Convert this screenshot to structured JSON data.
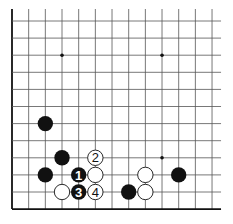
{
  "diagram": {
    "type": "go-board-fragment",
    "colors": {
      "background": "#ffffff",
      "line": "#555555",
      "edge": "#111111",
      "black_stone": "#111111",
      "white_stone": "#ffffff"
    },
    "grid": {
      "cols": 13,
      "rows": 12,
      "origin_x": 12,
      "origin_y": 21,
      "spacing_x": 16.67,
      "spacing_y": 17.1,
      "open_top": true,
      "open_right": true,
      "edge_left": true,
      "edge_bottom": true
    },
    "star_points": [
      {
        "col": 3,
        "row": 2
      },
      {
        "col": 9,
        "row": 2
      },
      {
        "col": 9,
        "row": 8
      }
    ],
    "stones": [
      {
        "color": "black",
        "col": 2,
        "row": 6,
        "label": ""
      },
      {
        "color": "black",
        "col": 3,
        "row": 8,
        "label": ""
      },
      {
        "color": "black",
        "col": 2,
        "row": 9,
        "label": ""
      },
      {
        "color": "black",
        "col": 4,
        "row": 9,
        "label": "1"
      },
      {
        "color": "black",
        "col": 4,
        "row": 10,
        "label": "3"
      },
      {
        "color": "black",
        "col": 7,
        "row": 10,
        "label": ""
      },
      {
        "color": "black",
        "col": 10,
        "row": 9,
        "label": ""
      },
      {
        "color": "white",
        "col": 5,
        "row": 8,
        "label": "2"
      },
      {
        "color": "white",
        "col": 5,
        "row": 9,
        "label": ""
      },
      {
        "color": "white",
        "col": 5,
        "row": 10,
        "label": "4"
      },
      {
        "color": "white",
        "col": 3,
        "row": 10,
        "label": ""
      },
      {
        "color": "white",
        "col": 8,
        "row": 9,
        "label": ""
      },
      {
        "color": "white",
        "col": 8,
        "row": 10,
        "label": ""
      }
    ],
    "move_labels": [
      "1",
      "2",
      "3",
      "4"
    ]
  }
}
